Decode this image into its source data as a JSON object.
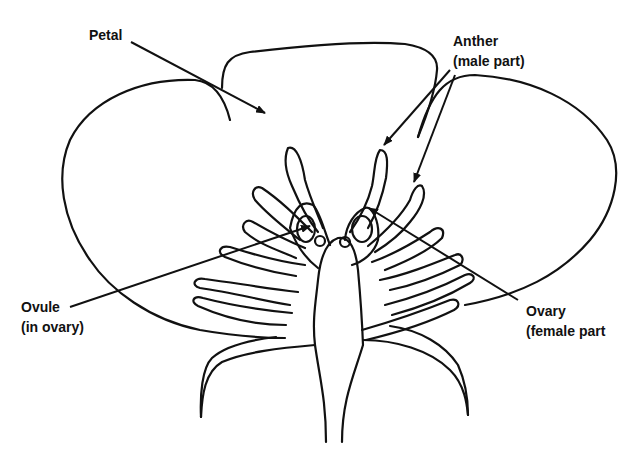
{
  "diagram": {
    "title": "",
    "labels": {
      "petal": {
        "line1": "Petal"
      },
      "anther": {
        "line1": "Anther",
        "line2": "(male part)"
      },
      "ovule": {
        "line1": "Ovule",
        "line2": "(in ovary)"
      },
      "ovary": {
        "line1": "Ovary",
        "line2": "(female part"
      }
    },
    "colors": {
      "stroke": "#111111",
      "background": "#ffffff"
    }
  }
}
